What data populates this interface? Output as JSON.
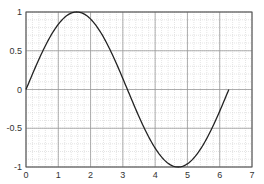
{
  "chart_data": {
    "type": "line",
    "title": "",
    "xlabel": "",
    "ylabel": "",
    "xlim": [
      0,
      7
    ],
    "ylim": [
      -1,
      1
    ],
    "grid": {
      "major": true,
      "minor": true
    },
    "legend": null,
    "x_ticks": [
      "0",
      "1",
      "2",
      "3",
      "4",
      "5",
      "6",
      "7"
    ],
    "y_ticks": [
      "1",
      "0.5",
      "0",
      "-0.5",
      "-1"
    ],
    "series": [
      {
        "name": "sin(x)",
        "color": "#222222",
        "function": "sin(x)",
        "x_range": [
          0,
          6.2832
        ],
        "x": [
          0,
          0.5,
          1.0,
          1.5708,
          2.0,
          2.5,
          3.1416,
          3.5,
          4.0,
          4.7124,
          5.0,
          5.5,
          6.0,
          6.2832
        ],
        "y": [
          0,
          0.479,
          0.841,
          1.0,
          0.909,
          0.598,
          0,
          -0.351,
          -0.757,
          -1.0,
          -0.959,
          -0.706,
          -0.279,
          0
        ]
      }
    ]
  }
}
